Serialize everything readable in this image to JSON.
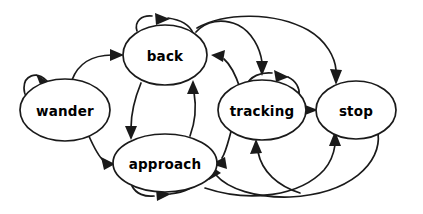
{
  "diagram": {
    "type": "state-machine-diagram",
    "title": "",
    "background_color": "#ffffff",
    "node_fill": "#ffffff",
    "node_stroke": "#1a1a1a",
    "edge_color": "#1a1a1a",
    "states": [
      {
        "id": "wander",
        "label": "wander",
        "cx": 65,
        "cy": 110,
        "rx": 45,
        "ry": 31
      },
      {
        "id": "back",
        "label": "back",
        "cx": 165,
        "cy": 55,
        "rx": 42,
        "ry": 30
      },
      {
        "id": "approach",
        "label": "approach",
        "cx": 165,
        "cy": 163,
        "rx": 52,
        "ry": 29
      },
      {
        "id": "tracking",
        "label": "tracking",
        "cx": 262,
        "cy": 110,
        "rx": 44,
        "ry": 30
      },
      {
        "id": "stop",
        "label": "stop",
        "cx": 356,
        "cy": 110,
        "rx": 40,
        "ry": 29
      }
    ],
    "transitions": [
      {
        "from": "wander",
        "to": "wander",
        "kind": "self-loop"
      },
      {
        "from": "wander",
        "to": "back",
        "kind": "curve"
      },
      {
        "from": "wander",
        "to": "approach",
        "kind": "curve"
      },
      {
        "from": "back",
        "to": "back",
        "kind": "self-loop"
      },
      {
        "from": "back",
        "to": "approach",
        "kind": "curve"
      },
      {
        "from": "approach",
        "to": "back",
        "kind": "curve"
      },
      {
        "from": "approach",
        "to": "approach",
        "kind": "self-loop"
      },
      {
        "from": "back",
        "to": "tracking",
        "kind": "curve"
      },
      {
        "from": "back",
        "to": "stop",
        "kind": "curve"
      },
      {
        "from": "tracking",
        "to": "tracking",
        "kind": "self-loop"
      },
      {
        "from": "tracking",
        "to": "back",
        "kind": "curve"
      },
      {
        "from": "tracking",
        "to": "approach",
        "kind": "curve"
      },
      {
        "from": "tracking",
        "to": "stop",
        "kind": "straight"
      },
      {
        "from": "stop",
        "to": "approach",
        "kind": "curve"
      },
      {
        "from": "stop",
        "to": "back",
        "kind": "curve"
      }
    ]
  }
}
